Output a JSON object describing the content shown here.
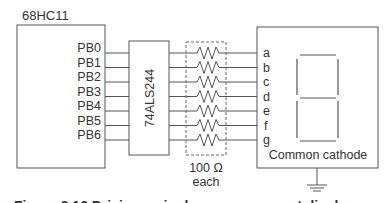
{
  "mcu": {
    "label": "68HC11",
    "ports": [
      "PB0",
      "PB1",
      "PB2",
      "PB3",
      "PB4",
      "PB5",
      "PB6"
    ]
  },
  "buffer": {
    "label": "74ALS244"
  },
  "resistors": {
    "value_label": "100 Ω",
    "each_label": "each",
    "count": 7
  },
  "display": {
    "segments": [
      "a",
      "b",
      "c",
      "d",
      "e",
      "f",
      "g"
    ],
    "type_label": "Common cathode"
  },
  "ground": {
    "icon": "ground-icon"
  },
  "caption": {
    "text": "Figure 8.16  Driving a single seven-segment display"
  },
  "colors": {
    "line": "#555555",
    "text": "#333333",
    "background": "#ffffff"
  }
}
